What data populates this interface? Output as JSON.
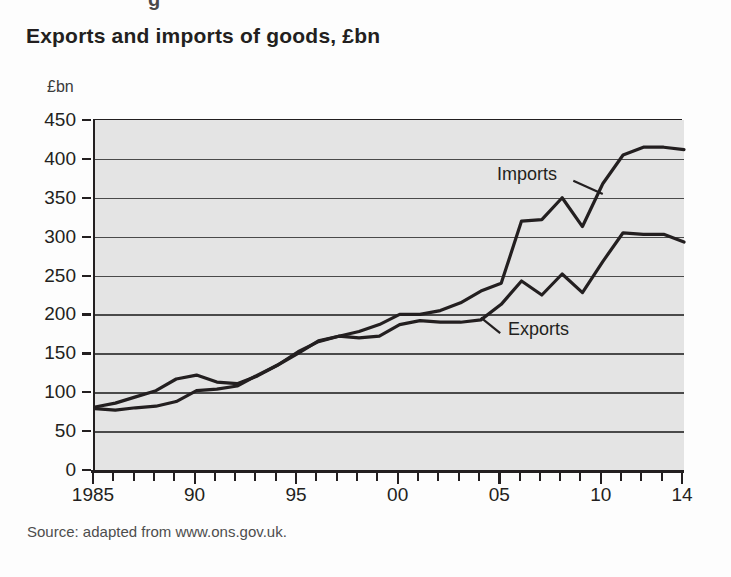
{
  "page": {
    "clipped_top_text": "g",
    "title": "Exports and imports of goods, £bn",
    "source": "Source: adapted from www.ons.gov.uk.",
    "y_axis_caption": "£bn",
    "plot_bg_color": "#e4e4e4",
    "line_color": "#231f20",
    "page_bg_color": "#fdfdfd"
  },
  "labels": {
    "imports": "Imports",
    "exports": "Exports"
  },
  "axis": {
    "y_ticks": [
      "0",
      "50",
      "100",
      "150",
      "200",
      "250",
      "300",
      "350",
      "400",
      "450"
    ],
    "x_tick_labels": [
      "1985",
      "90",
      "95",
      "00",
      "05",
      "10",
      "14"
    ],
    "x_tick_years": [
      1985,
      1990,
      1995,
      2000,
      2005,
      2010,
      2014
    ]
  },
  "chart_data": {
    "type": "line",
    "title": "Exports and imports of goods, £bn",
    "subtitle": "",
    "xlabel": "",
    "ylabel": "£bn",
    "ylim": [
      0,
      450
    ],
    "xlim": [
      1985,
      2014
    ],
    "ytick_step": 50,
    "grid": true,
    "legend": "inline-annotations",
    "source": "Source: adapted from www.ons.gov.uk.",
    "x": [
      1985,
      1986,
      1987,
      1988,
      1989,
      1990,
      1991,
      1992,
      1993,
      1994,
      1995,
      1996,
      1997,
      1998,
      1999,
      2000,
      2001,
      2002,
      2003,
      2004,
      2005,
      2006,
      2007,
      2008,
      2009,
      2010,
      2011,
      2012,
      2013,
      2014
    ],
    "series": [
      {
        "name": "Imports",
        "values": [
          81,
          86,
          94,
          102,
          117,
          122,
          113,
          111,
          121,
          135,
          150,
          166,
          172,
          178,
          187,
          200,
          200,
          205,
          215,
          230,
          240,
          320,
          322,
          350,
          313,
          368,
          405,
          415,
          415,
          412
        ]
      },
      {
        "name": "Exports",
        "values": [
          79,
          77,
          80,
          82,
          88,
          102,
          104,
          108,
          122,
          135,
          152,
          165,
          172,
          170,
          172,
          187,
          192,
          190,
          190,
          193,
          213,
          243,
          225,
          252,
          228,
          268,
          305,
          303,
          303,
          293
        ]
      }
    ],
    "annotations": [
      {
        "text": "Imports",
        "x": 2008,
        "y": 372,
        "points_to": {
          "x": 2010,
          "y": 355
        }
      },
      {
        "text": "Exports",
        "x": 2005.4,
        "y": 180,
        "points_to": {
          "x": 2004,
          "y": 196
        }
      }
    ]
  }
}
